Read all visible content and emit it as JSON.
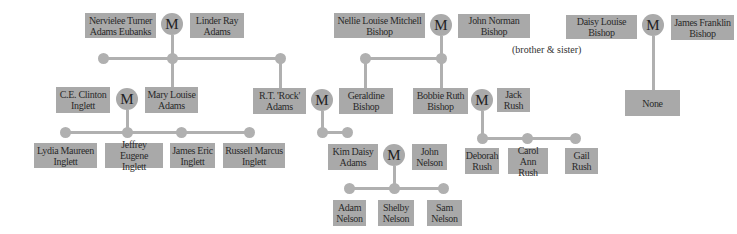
{
  "marriage_label": "M",
  "people": {
    "nervielee": "Nervielee Turner Adams Eubanks",
    "linder": "Linder Ray Adams",
    "ce_clinton": "C.E. Clinton Inglett",
    "mary_louise": "Mary Louise Adams",
    "rt_rock": "R.T. 'Rock' Adams",
    "lydia": "Lydia Maureen Inglett",
    "jeffrey": "Jeffrey Eugene Inglett",
    "james_eric": "James Eric Inglett",
    "russell": "Russell Marcus Inglett",
    "kim_daisy": "Kim Daisy Adams",
    "john_nelson": "John Nelson",
    "adam": "Adam Nelson",
    "shelby": "Shelby Nelson",
    "sam": "Sam Nelson",
    "nellie": "Nellie Louise Mitchell Bishop",
    "john_norman": "John Norman Bishop",
    "geraldine": "Geraldine Bishop",
    "bobbie_ruth": "Bobbie Ruth Bishop",
    "jack_rush": "Jack Rush",
    "deborah": "Deborah Rush",
    "carol_ann": "Carol Ann Rush",
    "gail": "Gail Rush",
    "daisy_louise": "Daisy Louise Bishop",
    "james_franklin": "James Franklin Bishop",
    "none": "None"
  },
  "notes": {
    "sibling_note": "(brother & sister)"
  }
}
